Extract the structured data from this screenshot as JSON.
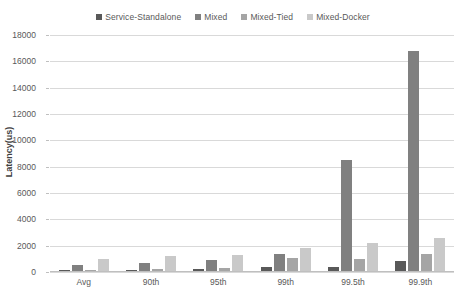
{
  "chart_data": {
    "type": "bar",
    "title": "",
    "xlabel": "",
    "ylabel": "Latency(us)",
    "ylim": [
      0,
      18000
    ],
    "ytick_step": 2000,
    "yticks": [
      0,
      2000,
      4000,
      6000,
      8000,
      10000,
      12000,
      14000,
      16000,
      18000
    ],
    "grid": true,
    "legend_position": "top",
    "categories": [
      "Avg",
      "90th",
      "95th",
      "99th",
      "99.5th",
      "99.9th"
    ],
    "series": [
      {
        "name": "Service-Standalone",
        "color": "#595959",
        "values": [
          150,
          180,
          250,
          350,
          400,
          850
        ]
      },
      {
        "name": "Mixed",
        "color": "#808080",
        "values": [
          500,
          700,
          900,
          1400,
          8500,
          16800
        ]
      },
      {
        "name": "Mixed-Tied",
        "color": "#a5a5a5",
        "values": [
          120,
          200,
          300,
          1100,
          1000,
          1400
        ]
      },
      {
        "name": "Mixed-Docker",
        "color": "#c9c9c9",
        "values": [
          1000,
          1200,
          1300,
          1800,
          2200,
          2550
        ]
      }
    ]
  },
  "axis": {
    "y_title": "Latency(us)"
  }
}
